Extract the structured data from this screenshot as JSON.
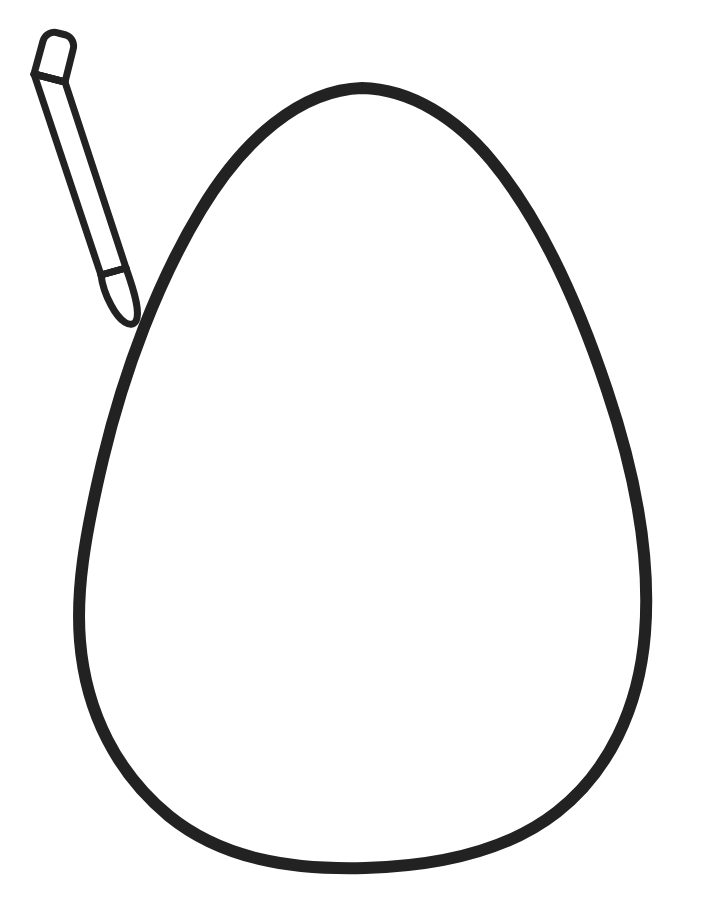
{
  "document": {
    "kind": "coloring-page-line-art",
    "title": "Easter Egg Coloring Page",
    "canvas_width": 709,
    "canvas_height": 901,
    "background_color": "#ffffff",
    "ink_color": "#222222",
    "text_content": []
  },
  "artwork": {
    "objects": [
      {
        "id": "egg",
        "name": "egg-outline",
        "description": "Large blank egg shape outline, open for coloring",
        "stroke_color": "#222222",
        "fill_color": "#ffffff",
        "stroke_width": 12,
        "bounds": {
          "x": 74,
          "y": 82,
          "width": 578,
          "height": 792
        },
        "extreme_points": {
          "top": [
            362,
            88
          ],
          "left": [
            80,
            610
          ],
          "right": [
            646,
            566
          ],
          "bottom": [
            365,
            868
          ]
        },
        "path": "M 362 88 C 300 90 243 140 201 210 C 158 281 124 371 103 459 C 84 539 76 592 80 641 C 86 714 118 774 169 816 C 222 859 291 870 365 868 C 438 866 506 852 557 812 C 608 772 639 709 645 633 C 651 556 634 470 607 390 C 579 306 541 220 491 160 C 457 119 411 89 362 88 Z"
      },
      {
        "id": "pencil",
        "name": "pencil-drawing-tool",
        "description": "Outlined pencil or crayon tilted toward the egg, tip pointing down-right",
        "stroke_color": "#222222",
        "fill_color": "#ffffff",
        "stroke_width": 7,
        "bounds": {
          "x": 20,
          "y": 30,
          "width": 125,
          "height": 298
        },
        "angle_degrees": 22,
        "parts": [
          {
            "id": "pencil-eraser",
            "name": "pencil-eraser-cap",
            "path": "M 34 74 L 43 41 C 45 34 52 31 58 33 L 66 35 C 72 37 75 44 73 50 L 65 82 Z"
          },
          {
            "id": "pencil-body",
            "name": "pencil-barrel",
            "path": "M 34 74 L 65 82 L 126 268 L 101 275 Z"
          },
          {
            "id": "pencil-tip",
            "name": "pencil-point-tip",
            "path": "M 101 275 L 126 268 C 136 296 140 313 136 321 C 131 329 120 322 111 305 C 105 294 102 283 101 275 Z"
          },
          {
            "id": "pencil-collar",
            "name": "pencil-ferrule-line",
            "path": "M 101 275 L 126 268"
          },
          {
            "id": "pencil-eraser-line",
            "name": "pencil-eraser-seam",
            "path": "M 34 74 L 65 82"
          }
        ]
      }
    ]
  },
  "accessibility": {
    "alt_text": "Black outline drawing of a large blank egg with a pencil in the upper left corner"
  }
}
